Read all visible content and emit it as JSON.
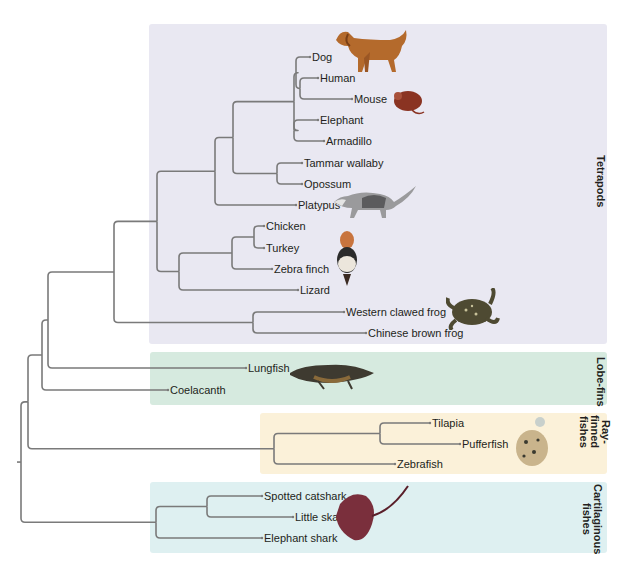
{
  "diagram": {
    "type": "phylogenetic-tree",
    "clades": [
      {
        "id": "tetrapods",
        "label": "Tetrapods",
        "color": "#e9e8f2"
      },
      {
        "id": "lobefins",
        "label": "Lobe-fins",
        "color": "#d6eadf"
      },
      {
        "id": "rayfinned",
        "label": "Ray-\nfinned\nfishes",
        "color": "#fbf1d9"
      },
      {
        "id": "cartilaginous",
        "label": "Cartilaginous\nfishes",
        "color": "#def0f1"
      }
    ],
    "leaves": [
      {
        "id": "dog",
        "label": "Dog",
        "clade": "tetrapods",
        "illustration": "dog"
      },
      {
        "id": "human",
        "label": "Human",
        "clade": "tetrapods"
      },
      {
        "id": "mouse",
        "label": "Mouse",
        "clade": "tetrapods",
        "illustration": "mouse"
      },
      {
        "id": "elephant",
        "label": "Elephant",
        "clade": "tetrapods"
      },
      {
        "id": "armadillo",
        "label": "Armadillo",
        "clade": "tetrapods"
      },
      {
        "id": "wallaby",
        "label": "Tammar wallaby",
        "clade": "tetrapods"
      },
      {
        "id": "opossum",
        "label": "Opossum",
        "clade": "tetrapods"
      },
      {
        "id": "platypus",
        "label": "Platypus",
        "clade": "tetrapods",
        "illustration": "opossum"
      },
      {
        "id": "chicken",
        "label": "Chicken",
        "clade": "tetrapods"
      },
      {
        "id": "turkey",
        "label": "Turkey",
        "clade": "tetrapods"
      },
      {
        "id": "zebrafinch",
        "label": "Zebra finch",
        "clade": "tetrapods",
        "illustration": "zebra-finch"
      },
      {
        "id": "lizard",
        "label": "Lizard",
        "clade": "tetrapods"
      },
      {
        "id": "wcfrog",
        "label": "Western clawed frog",
        "clade": "tetrapods",
        "illustration": "frog"
      },
      {
        "id": "cbfrog",
        "label": "Chinese brown frog",
        "clade": "tetrapods"
      },
      {
        "id": "lungfish",
        "label": "Lungfish",
        "clade": "lobefins",
        "illustration": "lungfish"
      },
      {
        "id": "coelacanth",
        "label": "Coelacanth",
        "clade": "lobefins"
      },
      {
        "id": "tilapia",
        "label": "Tilapia",
        "clade": "rayfinned"
      },
      {
        "id": "pufferfish",
        "label": "Pufferfish",
        "clade": "rayfinned",
        "illustration": "pufferfish"
      },
      {
        "id": "zebrafish",
        "label": "Zebrafish",
        "clade": "rayfinned"
      },
      {
        "id": "catshark",
        "label": "Spotted catshark",
        "clade": "cartilaginous"
      },
      {
        "id": "skate",
        "label": "Little skate",
        "clade": "cartilaginous",
        "illustration": "skate"
      },
      {
        "id": "elephantshark",
        "label": "Elephant shark",
        "clade": "cartilaginous"
      }
    ],
    "topology": [
      "root",
      [
        "bony",
        [
          "sarcopterygii",
          [
            "rhipidistia",
            [
              "tetrapods",
              [
                "amniotes",
                [
                  "mammals",
                  [
                    "therians",
                    [
                      "placentals",
                      [
                        "dog-group",
                        "dog",
                        [
                          "human-mouse",
                          "human",
                          "mouse"
                        ]
                      ],
                      [
                        "afro-xenarthra",
                        "elephant",
                        "armadillo"
                      ]
                    ],
                    [
                      "marsupials",
                      "wallaby",
                      "opossum"
                    ]
                  ],
                  "platypus"
                ],
                [
                  "sauropsids",
                  [
                    "birds",
                    [
                      "galliformes",
                      "chicken",
                      "turkey"
                    ],
                    "zebrafinch"
                  ],
                  "lizard"
                ]
              ],
              [
                "frogs",
                "wcfrog",
                "cbfrog"
              ]
            ],
            "lungfish"
          ],
          "coelacanth"
        ],
        [
          "actinopterygii",
          [
            "tilapia-puffer",
            "tilapia",
            "pufferfish"
          ],
          "zebrafish"
        ]
      ],
      [
        "chondrichthyes",
        [
          "catshark-skate",
          "catshark",
          "skate"
        ],
        "elephantshark"
      ]
    ]
  }
}
